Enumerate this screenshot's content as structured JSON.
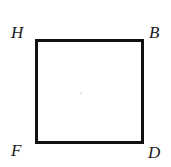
{
  "figure": {
    "shape": {
      "name": "square",
      "stroke_color": "#111111",
      "fill_color": "#ffffff",
      "stroke_width_px": 3
    },
    "background_color": "#ffffff",
    "vertices": [
      {
        "id": "top-left",
        "label": "H"
      },
      {
        "id": "top-right",
        "label": "B"
      },
      {
        "id": "bottom-left",
        "label": "F"
      },
      {
        "id": "bottom-right",
        "label": "D"
      }
    ]
  }
}
